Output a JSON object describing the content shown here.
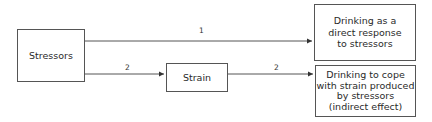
{
  "diagram": {
    "nodes": [
      {
        "id": "stressors",
        "label": "Stressors"
      },
      {
        "id": "strain",
        "label": "Strain"
      },
      {
        "id": "direct",
        "label": "Drinking as a\ndirect response\nto stressors"
      },
      {
        "id": "indirect",
        "label": "Drinking to cope\nwith strain produced\nby stressors\n(indirect effect)"
      }
    ],
    "edges": [
      {
        "from": "stressors",
        "to": "direct",
        "label": "1"
      },
      {
        "from": "stressors",
        "to": "strain",
        "label": "2"
      },
      {
        "from": "strain",
        "to": "indirect",
        "label": "2"
      }
    ],
    "colors": {
      "line": "#555555",
      "text": "#2a2a2a"
    }
  }
}
